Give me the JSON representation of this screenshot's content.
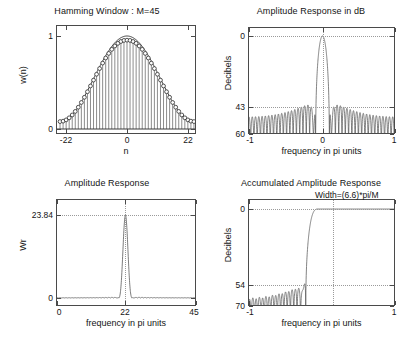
{
  "figure": {
    "width": 414,
    "height": 345,
    "background": "#ffffff",
    "line_color": "#4a4a4a",
    "grid_color": "#9a9a9a",
    "text_color": "#141414"
  },
  "chart_data": [
    {
      "id": "hamming-window",
      "type": "line",
      "subtype": "stem",
      "title": "Hamming Window : M=45",
      "xlabel": "n",
      "ylabel": "w(n)",
      "xlim": [
        -23,
        23
      ],
      "ylim": [
        0,
        1.12
      ],
      "xticks": [
        -22,
        0,
        22
      ],
      "xticklabels": [
        "-22",
        "0",
        "22"
      ],
      "yticks": [
        0,
        1
      ],
      "yticklabels": [
        "0",
        "1"
      ],
      "grid": false,
      "marker": "circle",
      "M": 45,
      "x": [
        -22,
        -21,
        -20,
        -19,
        -18,
        -17,
        -16,
        -15,
        -14,
        -13,
        -12,
        -11,
        -10,
        -9,
        -8,
        -7,
        -6,
        -5,
        -4,
        -3,
        -2,
        -1,
        0,
        1,
        2,
        3,
        4,
        5,
        6,
        7,
        8,
        9,
        10,
        11,
        12,
        13,
        14,
        15,
        16,
        17,
        18,
        19,
        20,
        21,
        22
      ],
      "values": [
        0.08,
        0.0845,
        0.098,
        0.1203,
        0.1509,
        0.1891,
        0.2342,
        0.2852,
        0.341,
        0.4005,
        0.4625,
        0.5256,
        0.5886,
        0.65,
        0.7087,
        0.7634,
        0.8129,
        0.8563,
        0.8926,
        0.9211,
        0.9412,
        0.9527,
        0.9553,
        0.9527,
        0.9412,
        0.9211,
        0.8926,
        0.8563,
        0.8129,
        0.7634,
        0.7087,
        0.65,
        0.5886,
        0.5256,
        0.4625,
        0.4005,
        0.341,
        0.2852,
        0.2342,
        0.1891,
        0.1509,
        0.1203,
        0.098,
        0.0845,
        0.08
      ]
    },
    {
      "id": "amplitude-response-db",
      "type": "line",
      "title": "Amplitude Response in dB",
      "xlabel": "frequency in pi units",
      "ylabel": "Decibels",
      "xlim": [
        -1,
        1
      ],
      "ylim": [
        -60,
        5
      ],
      "xticks": [
        -1,
        0,
        1
      ],
      "xticklabels": [
        "-1",
        "0",
        "1"
      ],
      "yticks": [
        0,
        -43,
        -60
      ],
      "yticklabels": [
        "0",
        "43",
        "60"
      ],
      "grid": true,
      "peak_db": 0,
      "sidelobe_db": -43,
      "floor_db": -60,
      "mainlobe_half_width_pi": 0.0733
    },
    {
      "id": "amplitude-response",
      "type": "line",
      "title": "Amplitude Response",
      "xlabel": "frequency in pi units",
      "ylabel": "Wr",
      "xlim": [
        0,
        45
      ],
      "ylim": [
        -1.6,
        26.5
      ],
      "xticks": [
        0,
        22,
        45
      ],
      "xticklabels": [
        "0",
        "22",
        "45"
      ],
      "yticks": [
        0,
        23.84
      ],
      "yticklabels": [
        "0",
        "23.84"
      ],
      "grid": true,
      "peak_value": 23.84,
      "peak_x": 22
    },
    {
      "id": "accumulated-amplitude-response",
      "type": "line",
      "title": "Accumulated Amplitude Response",
      "xlabel": "frequency in pi units",
      "ylabel": "Decibels",
      "xlim": [
        -1,
        1
      ],
      "ylim": [
        -70,
        6
      ],
      "xticks": [
        -1,
        1
      ],
      "xticklabels": [
        "-1",
        "1"
      ],
      "yticks": [
        0,
        -54,
        -70
      ],
      "yticklabels": [
        "0",
        "54",
        "70"
      ],
      "grid": true,
      "annotation": "Width=(6.6)*pi/M",
      "transition_x": -0.147,
      "plateau_db": 0,
      "ripple_peak_db": -54,
      "floor_db": -70
    }
  ]
}
